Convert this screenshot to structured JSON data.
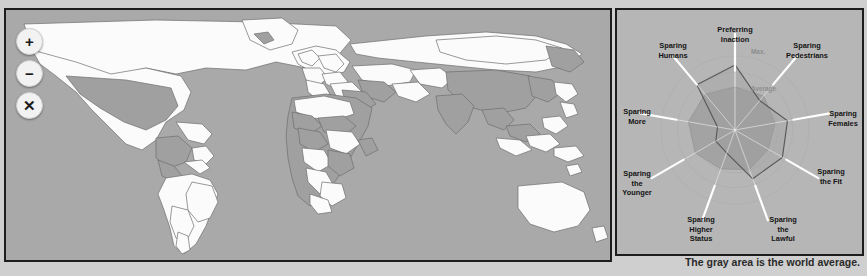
{
  "map": {
    "name": "world-choropleth-map",
    "ocean_color": "#a9a9a9",
    "country_fill_light": "#fbfbfb",
    "country_fill_dark": "#a0a0a0",
    "border_color": "#6e6e6e",
    "controls": [
      {
        "name": "zoom-in-button",
        "glyph": "+",
        "title": "Zoom in"
      },
      {
        "name": "zoom-out-button",
        "glyph": "−",
        "title": "Zoom out"
      },
      {
        "name": "close-button",
        "glyph": "✕",
        "title": "Close"
      }
    ]
  },
  "caption": "The gray area is the world average.",
  "chart_data": {
    "type": "radar",
    "title": "",
    "legend": [
      "World average",
      "Selected cluster"
    ],
    "legend_position": "below-chart",
    "grid": true,
    "ring_labels": [
      "Max.",
      "Average"
    ],
    "rings": [
      1.0,
      0.58
    ],
    "rmin": 0,
    "rmax": 1.0,
    "categories": [
      "Preferring Inaction",
      "Sparing Pedestrians",
      "Sparing Females",
      "Sparing the Fit",
      "Sparing the Lawful",
      "Sparing Higher Status",
      "Sparing the Younger",
      "Sparing More",
      "Sparing Humans"
    ],
    "series": [
      {
        "name": "World average",
        "style": "filled-gray-area",
        "color": "#9a9a9a",
        "values": [
          0.58,
          0.6,
          0.55,
          0.52,
          0.57,
          0.56,
          0.62,
          0.64,
          0.63
        ]
      },
      {
        "name": "Selected cluster",
        "style": "dark-outline",
        "color": "#5a5a5a",
        "values": [
          0.88,
          0.52,
          0.72,
          0.74,
          0.7,
          0.33,
          0.3,
          0.24,
          0.8
        ]
      }
    ]
  }
}
